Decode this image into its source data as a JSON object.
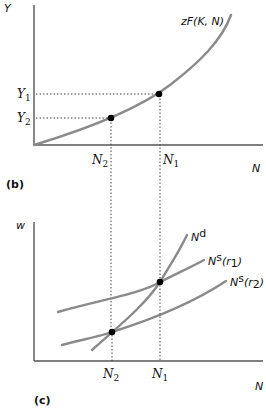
{
  "panel_b": {
    "label": "(b)",
    "y_axis_label": "Y",
    "x_axis_label": "N",
    "curve_label": "zF(K, N)",
    "y_ticks": [
      {
        "main": "Y",
        "sub": "1"
      },
      {
        "main": "Y",
        "sub": "2"
      }
    ],
    "x_ticks": [
      {
        "main": "N",
        "sub": "2"
      },
      {
        "main": "N",
        "sub": "1"
      }
    ]
  },
  "panel_c": {
    "label": "(c)",
    "y_axis_label": "w",
    "x_axis_label": "N",
    "curves": [
      {
        "main": "N",
        "sup": "d",
        "suffix": ""
      },
      {
        "main": "N",
        "sup": "s",
        "suffix": "(r",
        "sub": "1",
        "close": ")"
      },
      {
        "main": "N",
        "sup": "s",
        "suffix": "(r",
        "sub": "2",
        "close": ")"
      }
    ],
    "x_ticks": [
      {
        "main": "N",
        "sub": "2"
      },
      {
        "main": "N",
        "sub": "1"
      }
    ]
  },
  "colors": {
    "curve": "#8a8a8a",
    "axis": "#555555",
    "point": "#000000"
  }
}
